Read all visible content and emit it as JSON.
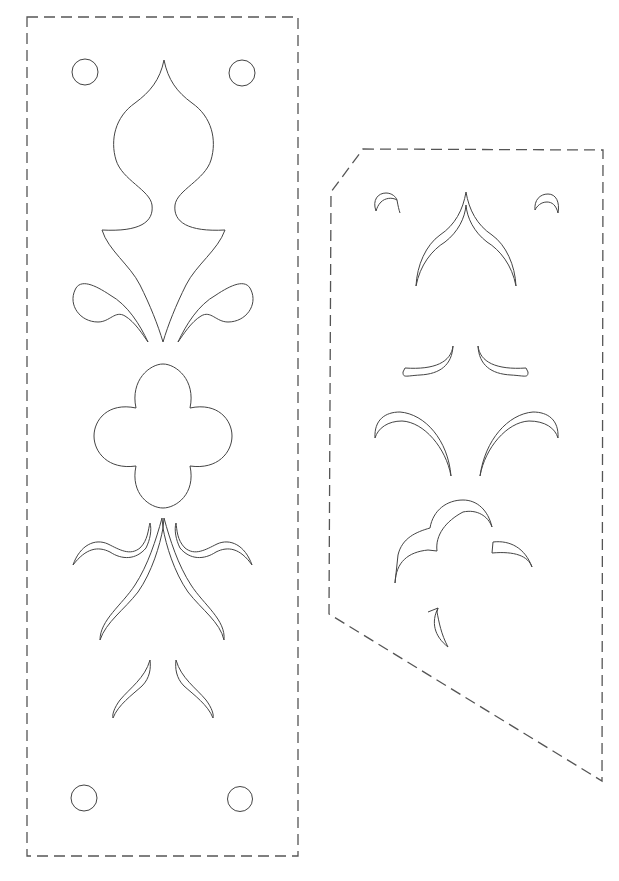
{
  "caption": "",
  "colors": {
    "line": "#444444",
    "dash": "#555555",
    "background": "#ffffff"
  },
  "panels": [
    {
      "id": "left-panel",
      "label": "Stencil panel A (rectangular)",
      "outline": "dashed-rectangle",
      "elements": [
        "mounting-hole-top-left",
        "mounting-hole-top-right",
        "fleur-de-lis-cutout",
        "quatrefoil-cutout",
        "wave-swoosh-left",
        "wave-swoosh-right",
        "long-swoosh-left",
        "long-swoosh-right",
        "small-swoosh-left",
        "small-swoosh-right",
        "mounting-hole-bottom-left",
        "mounting-hole-bottom-right"
      ]
    },
    {
      "id": "right-panel",
      "label": "Stencil panel B (chamfered, slanted bottom)",
      "outline": "dashed-polygon",
      "elements": [
        "crescent-top-left",
        "crescent-top-right",
        "arch-cutout",
        "leaf-left",
        "leaf-right",
        "large-arc-left",
        "large-arc-right",
        "cloud-arc-cutout",
        "small-arc-right",
        "hook-cutout"
      ]
    }
  ]
}
